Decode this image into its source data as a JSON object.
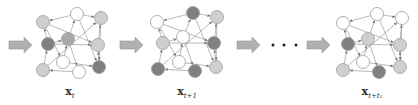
{
  "diagram": {
    "colors": {
      "white": "#ffffff",
      "light": "#cfcfcf",
      "mid": "#a8a8a8",
      "dark": "#808080",
      "edge": "#8a8a8a",
      "stroke": "#9a9a9a",
      "arrow_fill": "#b0b0b0"
    },
    "ellipsis": "• • •",
    "graphs": [
      {
        "label_main": "x",
        "label_sub": "t",
        "nodes": [
          {
            "x": 43,
            "y": 22,
            "c": "light"
          },
          {
            "x": 77,
            "y": 14,
            "c": "white"
          },
          {
            "x": 101,
            "y": 18,
            "c": "light"
          },
          {
            "x": 48,
            "y": 44,
            "c": "dark"
          },
          {
            "x": 68,
            "y": 39,
            "c": "mid"
          },
          {
            "x": 98,
            "y": 45,
            "c": "light"
          },
          {
            "x": 63,
            "y": 62,
            "c": "white"
          },
          {
            "x": 43,
            "y": 70,
            "c": "light"
          },
          {
            "x": 79,
            "y": 72,
            "c": "white"
          },
          {
            "x": 99,
            "y": 67,
            "c": "dark"
          }
        ]
      },
      {
        "label_main": "x",
        "label_sub": "t+1",
        "nodes": [
          {
            "x": 157,
            "y": 22,
            "c": "white"
          },
          {
            "x": 193,
            "y": 13,
            "c": "dark"
          },
          {
            "x": 217,
            "y": 17,
            "c": "light"
          },
          {
            "x": 163,
            "y": 43,
            "c": "light"
          },
          {
            "x": 183,
            "y": 37,
            "c": "white"
          },
          {
            "x": 214,
            "y": 43,
            "c": "dark"
          },
          {
            "x": 179,
            "y": 62,
            "c": "white"
          },
          {
            "x": 158,
            "y": 69,
            "c": "dark"
          },
          {
            "x": 195,
            "y": 71,
            "c": "dark"
          },
          {
            "x": 216,
            "y": 67,
            "c": "light"
          }
        ]
      },
      {
        "label_main": "x",
        "label_sub": "t+t₁",
        "nodes": [
          {
            "x": 343,
            "y": 23,
            "c": "white"
          },
          {
            "x": 377,
            "y": 14,
            "c": "white"
          },
          {
            "x": 402,
            "y": 18,
            "c": "white"
          },
          {
            "x": 348,
            "y": 44,
            "c": "dark"
          },
          {
            "x": 368,
            "y": 39,
            "c": "light"
          },
          {
            "x": 400,
            "y": 45,
            "c": "light"
          },
          {
            "x": 363,
            "y": 62,
            "c": "white"
          },
          {
            "x": 343,
            "y": 70,
            "c": "light"
          },
          {
            "x": 379,
            "y": 72,
            "c": "dark"
          },
          {
            "x": 400,
            "y": 67,
            "c": "light"
          }
        ]
      }
    ],
    "edges": [
      [
        1,
        0
      ],
      [
        1,
        2
      ],
      [
        0,
        5
      ],
      [
        3,
        0
      ],
      [
        4,
        1
      ],
      [
        5,
        2
      ],
      [
        3,
        5
      ],
      [
        6,
        4
      ],
      [
        7,
        3
      ],
      [
        8,
        7
      ],
      [
        6,
        9
      ],
      [
        9,
        5
      ],
      [
        2,
        9
      ],
      [
        7,
        2
      ],
      [
        4,
        8
      ],
      [
        1,
        9
      ],
      [
        0,
        6
      ],
      [
        3,
        4
      ]
    ],
    "arrows": [
      {
        "x": 9,
        "y": 45
      },
      {
        "x": 120,
        "y": 45
      },
      {
        "x": 237,
        "y": 45
      },
      {
        "x": 307,
        "y": 45
      }
    ],
    "labels_pos": [
      {
        "x": 70,
        "y": 85
      },
      {
        "x": 187,
        "y": 85
      },
      {
        "x": 372,
        "y": 85
      }
    ]
  }
}
